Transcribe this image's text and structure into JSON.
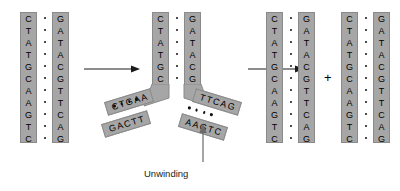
{
  "figure": {
    "caption_unwinding": "Unwinding",
    "plus_symbol": "+",
    "colors": {
      "strand_fill": "#a6a6a6",
      "strand_border": "#8a8a8a",
      "base_text": "#000000",
      "bond_dot": "#111111",
      "background": "#ffffff",
      "arrow": "#1a1a1a",
      "caption_text": "#222222"
    }
  },
  "sequences": {
    "top_strand": "CTATGCAAGTC",
    "bottom_strand": "GATACGTTCAG",
    "top_bases": [
      "C",
      "T",
      "A",
      "T",
      "G",
      "C",
      "A",
      "A",
      "G",
      "T",
      "C"
    ],
    "bottom_bases": [
      "G",
      "A",
      "T",
      "A",
      "C",
      "G",
      "T",
      "T",
      "C",
      "A",
      "G"
    ],
    "base_pair_count": 11
  },
  "panels": [
    {
      "id": "panel-1",
      "name": "intact-duplex",
      "label": "Intact double helix",
      "left_strand": {
        "name": "left-strand",
        "bases": [
          "C",
          "T",
          "A",
          "T",
          "G",
          "C",
          "A",
          "A",
          "G",
          "T",
          "C"
        ]
      },
      "right_strand": {
        "name": "right-strand",
        "bases": [
          "G",
          "A",
          "T",
          "A",
          "C",
          "G",
          "T",
          "T",
          "C",
          "A",
          "G"
        ]
      },
      "bond_count": 11
    },
    {
      "id": "panel-2",
      "name": "replication-fork",
      "label": "Unwinding fork",
      "left_stem": {
        "name": "fork-left-stem",
        "bases": [
          "C",
          "T",
          "A",
          "T",
          "G",
          "C"
        ]
      },
      "right_stem": {
        "name": "fork-right-stem",
        "bases": [
          "G",
          "A",
          "T",
          "A",
          "C",
          "G"
        ]
      },
      "stem_bond_count": 6,
      "branches": [
        {
          "name": "upper-left-branch",
          "text": "CTGAA",
          "side": "left",
          "row": "upper"
        },
        {
          "name": "lower-left-branch",
          "text": "GACTT",
          "side": "left",
          "row": "lower"
        },
        {
          "name": "upper-right-branch",
          "text": "TTCAG",
          "side": "right",
          "row": "upper"
        },
        {
          "name": "lower-right-branch",
          "text": "AAGTC",
          "side": "right",
          "row": "lower"
        }
      ],
      "branch_bond_count": 4
    },
    {
      "id": "panel-3",
      "name": "daughter-duplex-a",
      "label": "Daughter duplex A",
      "left_strand": {
        "name": "daughter-a-left-strand",
        "bases": [
          "C",
          "T",
          "A",
          "T",
          "G",
          "C",
          "A",
          "A",
          "G",
          "T",
          "C"
        ]
      },
      "right_strand": {
        "name": "daughter-a-right-strand",
        "bases": [
          "G",
          "A",
          "T",
          "A",
          "C",
          "G",
          "T",
          "T",
          "C",
          "A",
          "G"
        ]
      },
      "bond_count": 11
    },
    {
      "id": "panel-4",
      "name": "daughter-duplex-b",
      "label": "Daughter duplex B",
      "left_strand": {
        "name": "daughter-b-left-strand",
        "bases": [
          "C",
          "T",
          "A",
          "T",
          "G",
          "C",
          "A",
          "A",
          "G",
          "T",
          "C"
        ]
      },
      "right_strand": {
        "name": "daughter-b-right-strand",
        "bases": [
          "G",
          "A",
          "T",
          "A",
          "C",
          "G",
          "T",
          "T",
          "C",
          "A",
          "G"
        ]
      },
      "bond_count": 11
    }
  ],
  "arrows": [
    {
      "name": "arrow-step-1",
      "direction": "right"
    },
    {
      "name": "arrow-step-2",
      "direction": "right"
    },
    {
      "name": "arrow-unwinding-pointer",
      "direction": "up"
    }
  ]
}
